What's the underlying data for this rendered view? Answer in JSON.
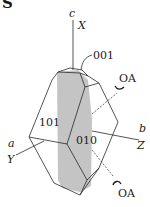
{
  "figure": {
    "panel_label": "S",
    "axes": {
      "c": {
        "crystal": "c",
        "optical": "X"
      },
      "b": {
        "crystal": "b",
        "optical": "Z"
      },
      "a": {
        "crystal": "a",
        "optical": "Y"
      }
    },
    "faces": {
      "top": "001",
      "left": "101",
      "front": "010"
    },
    "optic_axes": [
      "OA",
      "OA"
    ],
    "colors": {
      "line": "#2a2a2a",
      "shaded_plane": "#c4c4c4",
      "background": "#ffffff"
    }
  }
}
